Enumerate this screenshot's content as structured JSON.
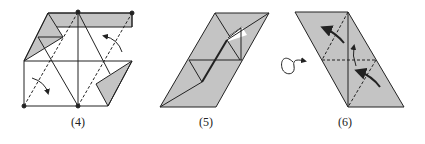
{
  "figures": [
    {
      "id": "step-4",
      "label": "(4)",
      "label_x": 78,
      "label_y": 119
    },
    {
      "id": "step-5",
      "label": "(5)",
      "label_x": 214,
      "label_y": 119
    },
    {
      "id": "step-6",
      "label": "(6)",
      "label_x": 345,
      "label_y": 119
    }
  ],
  "colors": {
    "fill": "#c4c4c4",
    "line": "#222222",
    "background": "#ffffff"
  },
  "symbols": {
    "turn_over": "turn-over-icon"
  }
}
